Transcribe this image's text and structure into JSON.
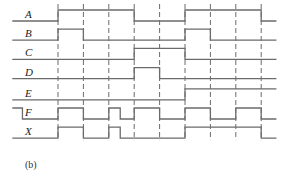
{
  "caption": "(b)",
  "time_markers": [
    1,
    2,
    3,
    4,
    5,
    6,
    7,
    8,
    9
  ],
  "signals": [
    {
      "name": "A",
      "initial": 0,
      "edges": [
        [
          1,
          1
        ],
        [
          4,
          0
        ],
        [
          6,
          1
        ],
        [
          9,
          0
        ]
      ]
    },
    {
      "name": "B",
      "initial": 0,
      "edges": [
        [
          1,
          1
        ],
        [
          2,
          0
        ],
        [
          6,
          1
        ],
        [
          7,
          0
        ]
      ]
    },
    {
      "name": "C",
      "initial": 0,
      "edges": [
        [
          4,
          1
        ],
        [
          6,
          0
        ]
      ]
    },
    {
      "name": "D",
      "initial": 0,
      "edges": [
        [
          4,
          1
        ],
        [
          5,
          0
        ]
      ]
    },
    {
      "name": "E",
      "initial": 0,
      "edges": [
        [
          6,
          1
        ]
      ]
    },
    {
      "name": "F",
      "initial": 1,
      "edges": [
        [
          -0.4,
          0
        ],
        [
          1,
          1
        ],
        [
          2,
          0
        ],
        [
          3,
          1
        ],
        [
          3.45,
          0
        ],
        [
          4,
          1
        ],
        [
          5,
          0
        ],
        [
          6,
          1
        ],
        [
          7,
          0
        ],
        [
          8,
          1
        ],
        [
          9,
          0
        ]
      ]
    },
    {
      "name": "X",
      "initial": 0,
      "edges": [
        [
          1,
          1
        ],
        [
          2,
          0
        ],
        [
          3,
          1
        ],
        [
          3.45,
          0
        ],
        [
          6,
          1
        ],
        [
          9,
          0
        ]
      ]
    }
  ],
  "time_range": [
    -0.8,
    9.6
  ]
}
